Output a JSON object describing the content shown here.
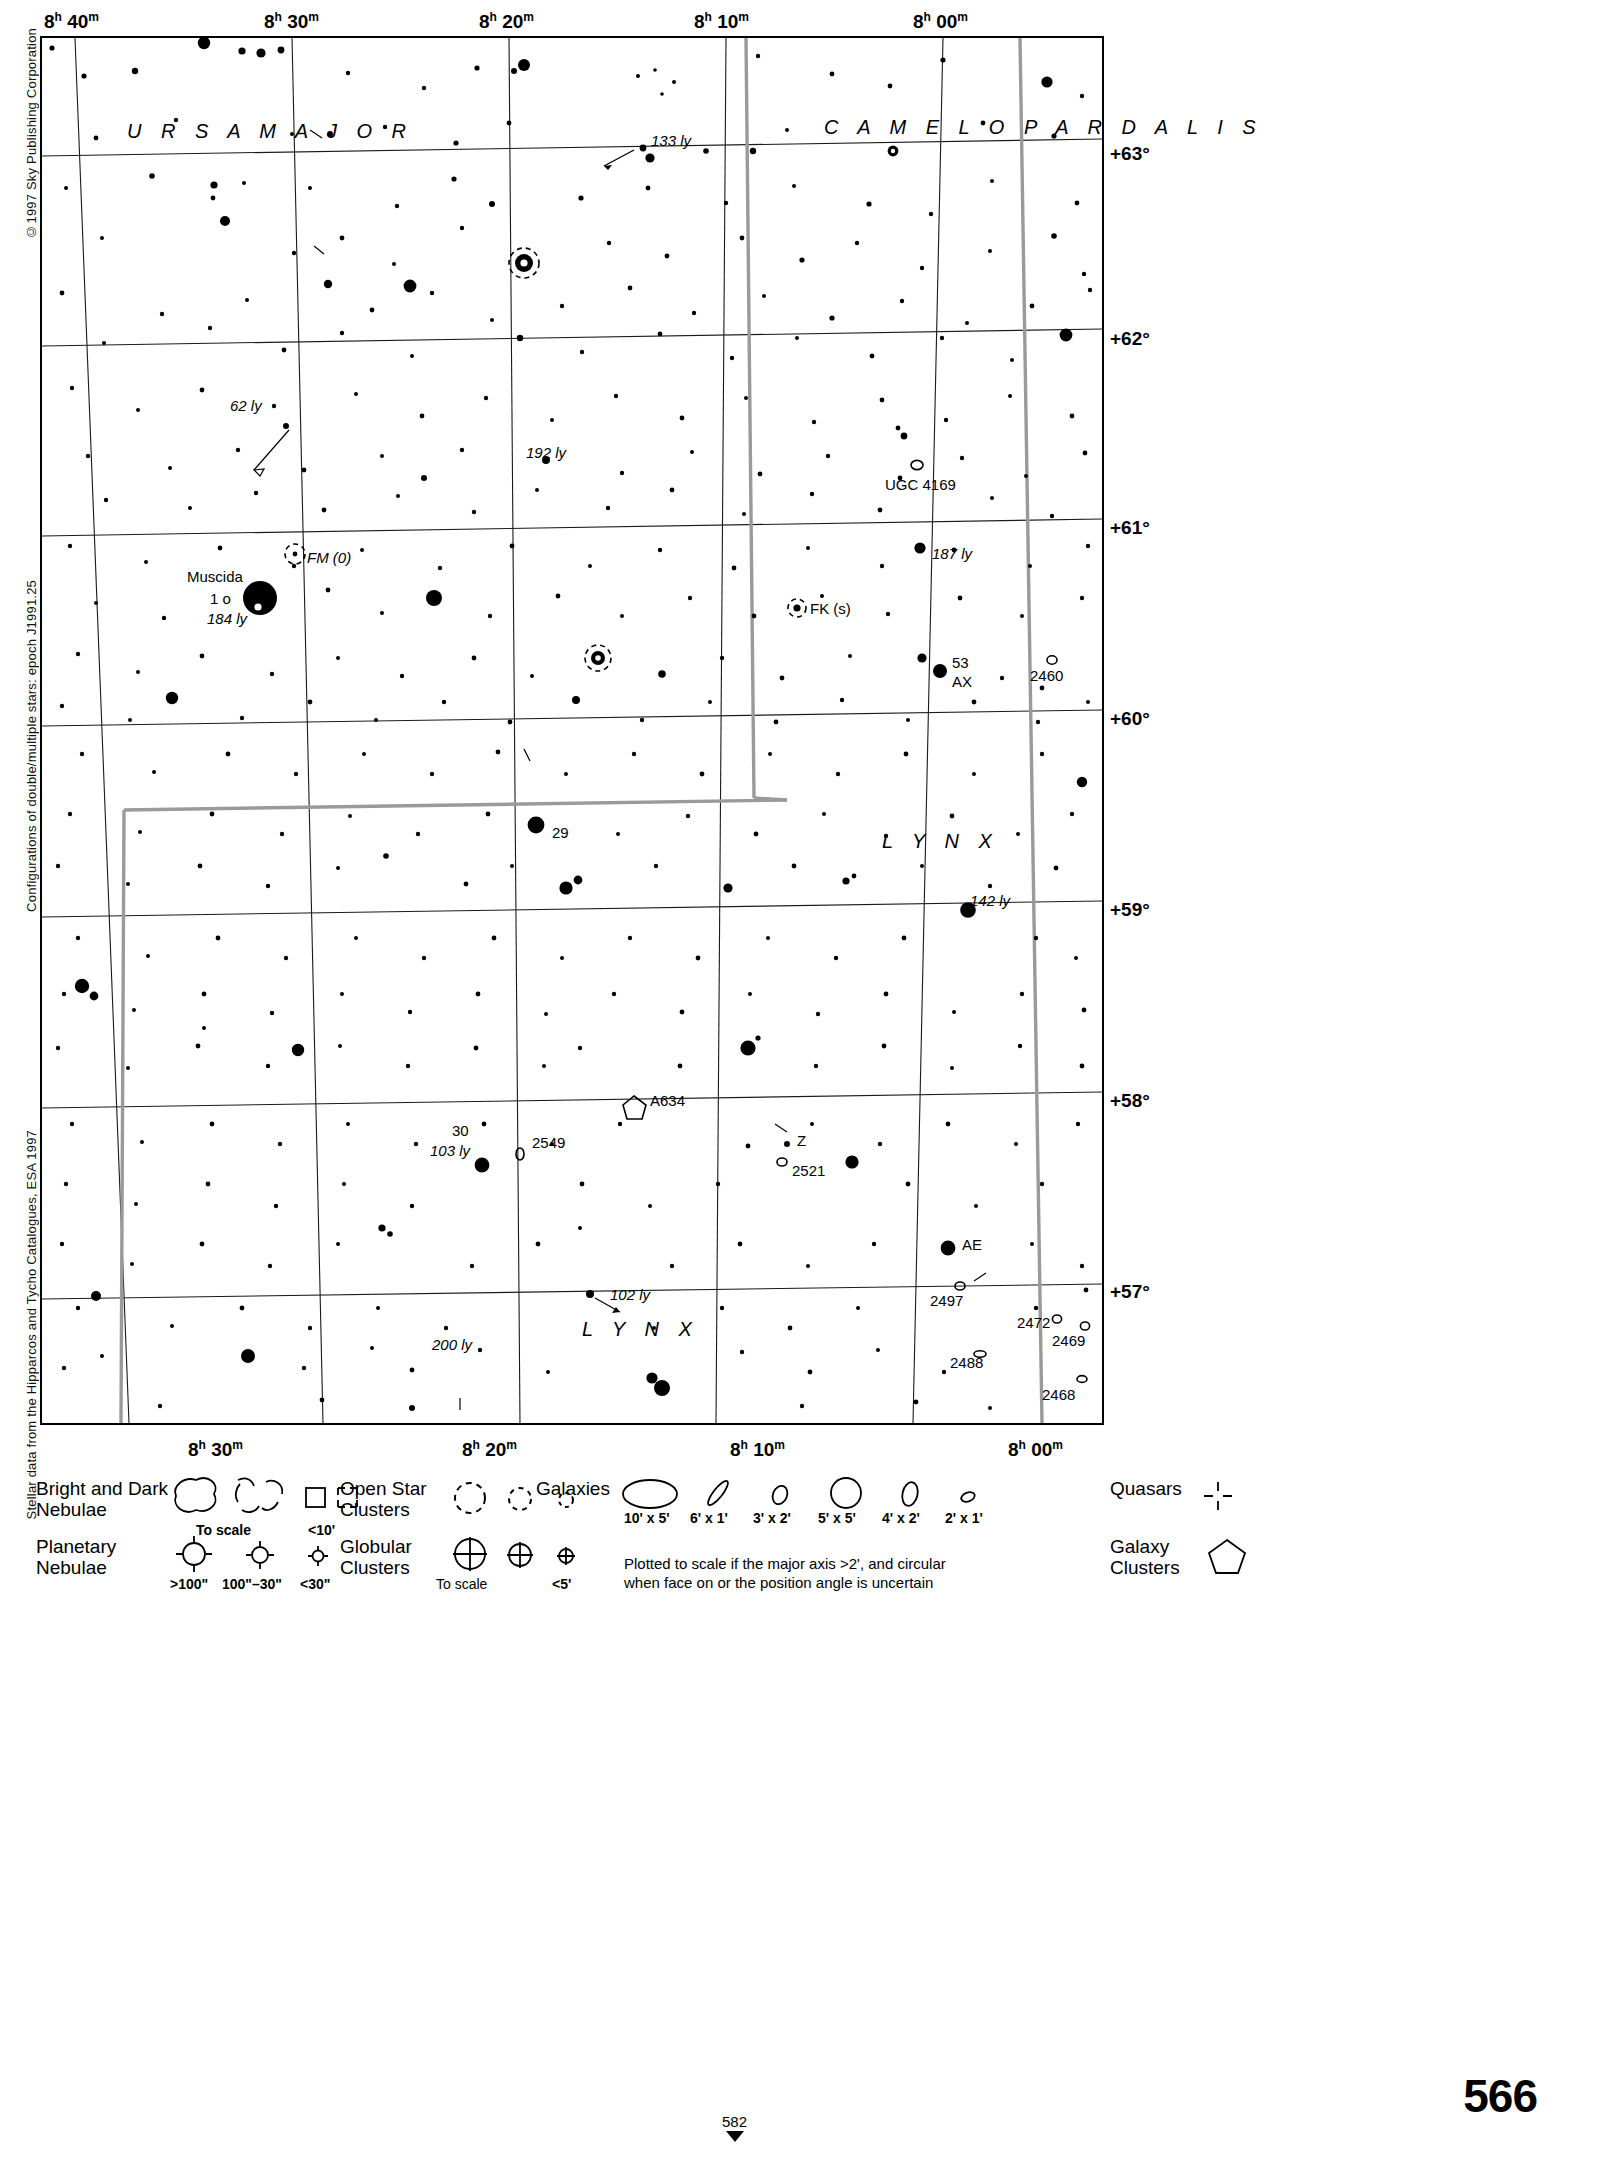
{
  "page": {
    "number": "566",
    "continuation_marker": "582",
    "credits": {
      "copyright": "©1997 Sky Publishing Corporation",
      "double_stars": "Configurations of double/multiple stars: epoch J1991.25",
      "hipparcos": "Stellar data from the Hipparcos and Tycho Catalogues, ESA 1997"
    }
  },
  "chart_data": {
    "type": "scatter",
    "xlabel": "Right Ascension",
    "ylabel": "Declination",
    "projection": "equatorial, epoch J2000",
    "grid": true,
    "ra_range": [
      "8h 00m",
      "8h 45m"
    ],
    "dec_range": [
      "+56.5",
      "+63.8"
    ],
    "ra_ticks_top": [
      "8h 40m",
      "8h 30m",
      "8h 20m",
      "8h 10m",
      "8h 00m"
    ],
    "ra_ticks_bottom": [
      "8h 30m",
      "8h 20m",
      "8h 10m",
      "8h 00m"
    ],
    "dec_ticks": [
      "+63°",
      "+62°",
      "+61°",
      "+60°",
      "+59°",
      "+58°",
      "+57°"
    ],
    "constellations": [
      {
        "name": "U R S A   M A J O R",
        "x": 225,
        "y": 128
      },
      {
        "name": "C A M E L O P A R D A L I S",
        "x": 925,
        "y": 124
      },
      {
        "name": "L Y N X",
        "x": 879,
        "y": 843
      },
      {
        "name": "L Y N X",
        "x": 580,
        "y": 1331
      }
    ],
    "labeled_objects": [
      {
        "label": "133 ly",
        "kind": "distance",
        "x": 623,
        "y": 139
      },
      {
        "label": "62 ly",
        "kind": "distance",
        "x": 247,
        "y": 404
      },
      {
        "label": "192 ly",
        "kind": "distance",
        "x": 545,
        "y": 452
      },
      {
        "label": "UGC 4169",
        "kind": "galaxy",
        "x": 917,
        "y": 486
      },
      {
        "label": "FM (0)",
        "kind": "variable",
        "x": 317,
        "y": 558
      },
      {
        "label": "187 ly",
        "kind": "distance",
        "x": 945,
        "y": 552
      },
      {
        "label": "Muscida",
        "kind": "starname",
        "x": 219,
        "y": 576
      },
      {
        "label": "1 ο",
        "kind": "bayer",
        "x": 222,
        "y": 597
      },
      {
        "label": "184 ly",
        "kind": "distance",
        "x": 224,
        "y": 616
      },
      {
        "label": "FK (s)",
        "kind": "variable",
        "x": 821,
        "y": 608
      },
      {
        "label": "53",
        "kind": "flamsteed",
        "x": 958,
        "y": 664
      },
      {
        "label": "AX",
        "kind": "variable",
        "x": 958,
        "y": 682
      },
      {
        "label": "2460",
        "kind": "galaxy",
        "x": 1062,
        "y": 673
      },
      {
        "label": "29",
        "kind": "flamsteed",
        "x": 561,
        "y": 831
      },
      {
        "label": "142 ly",
        "kind": "distance",
        "x": 989,
        "y": 899
      },
      {
        "label": "A634",
        "kind": "galaxycl",
        "x": 661,
        "y": 1102
      },
      {
        "label": "2549",
        "kind": "galaxy",
        "x": 545,
        "y": 1146
      },
      {
        "label": "30",
        "kind": "flamsteed",
        "x": 461,
        "y": 1131
      },
      {
        "label": "103 ly",
        "kind": "distance",
        "x": 450,
        "y": 1150
      },
      {
        "label": "Z",
        "kind": "variable",
        "x": 800,
        "y": 1140
      },
      {
        "label": "2521",
        "kind": "galaxy",
        "x": 807,
        "y": 1167
      },
      {
        "label": "AE",
        "kind": "variable",
        "x": 971,
        "y": 1241
      },
      {
        "label": "102 ly",
        "kind": "distance",
        "x": 623,
        "y": 1291
      },
      {
        "label": "2497",
        "kind": "galaxy",
        "x": 948,
        "y": 1294
      },
      {
        "label": "200 ly",
        "kind": "distance",
        "x": 450,
        "y": 1343
      },
      {
        "label": "2472",
        "kind": "galaxy",
        "x": 1040,
        "y": 1322
      },
      {
        "label": "2469",
        "kind": "galaxy",
        "x": 1075,
        "y": 1340
      },
      {
        "label": "2488",
        "kind": "galaxy",
        "x": 962,
        "y": 1363
      },
      {
        "label": "2468",
        "kind": "galaxy",
        "x": 1066,
        "y": 1395
      }
    ]
  },
  "legend": {
    "bright_dark_nebulae": {
      "line1": "Bright and Dark",
      "line2": "Nebulae",
      "cap_to_scale": "To scale",
      "cap_small": "<10'"
    },
    "planetary_nebulae": {
      "line1": "Planetary",
      "line2": "Nebulae",
      "cap_large": ">100\"",
      "cap_mid": "100\"–30\"",
      "cap_small": "<30\""
    },
    "open_clusters": {
      "line1": "Open Star",
      "line2": "Clusters"
    },
    "globular_clusters": {
      "line1": "Globular",
      "line2": "Clusters",
      "cap_to_scale": "To scale",
      "cap_small": "<5'"
    },
    "galaxies": {
      "title": "Galaxies",
      "sizes": [
        "10' x 5'",
        "6' x 1'",
        "3' x 2'",
        "5' x 5'",
        "4' x 2'",
        "2' x 1'"
      ],
      "note_line1": "Plotted to scale if the major axis >2', and circular",
      "note_line2": "when face on or the position angle is uncertain"
    },
    "quasars": {
      "title": "Quasars"
    },
    "galaxy_clusters": {
      "line1": "Galaxy",
      "line2": "Clusters"
    }
  }
}
